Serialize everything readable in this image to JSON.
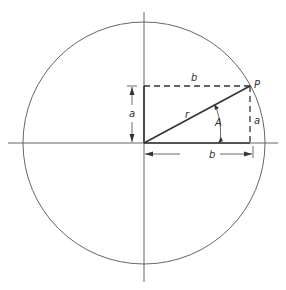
{
  "figure": {
    "type": "unit-circle-polar-diagram",
    "labels": {
      "point": "P",
      "radius": "r",
      "angle": "A",
      "vertical_leg": "a",
      "horizontal_leg": "b"
    },
    "colors": {
      "line": "#333333",
      "background": "#ffffff"
    }
  }
}
